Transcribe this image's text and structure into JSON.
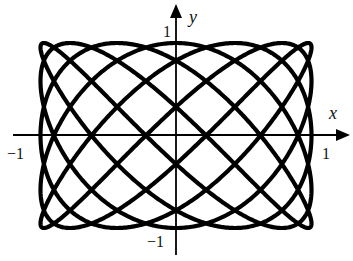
{
  "chart_data": {
    "type": "line",
    "title": "",
    "subtitle": "",
    "curve": {
      "kind": "parametric",
      "x_expr": "sin(5t)",
      "y_expr": "cos(7t)",
      "x_freq": 5,
      "y_freq": 7,
      "x_func": "sin",
      "y_func": "cos",
      "t_range": [
        0,
        6.283185307
      ],
      "samples": 2400,
      "stroke_color": "#000000",
      "stroke_width": 4.2
    },
    "xlabel": "x",
    "ylabel": "y",
    "xlim": [
      -1.3,
      1.3
    ],
    "ylim": [
      -1.3,
      1.3
    ],
    "x_ticks": [
      {
        "value": -1,
        "label": "−1"
      },
      {
        "value": 1,
        "label": "1"
      }
    ],
    "y_ticks": [
      {
        "value": 1,
        "label": "1"
      },
      {
        "value": -1,
        "label": "−1"
      }
    ],
    "grid": false,
    "legend": null,
    "axes_color": "#000000"
  }
}
